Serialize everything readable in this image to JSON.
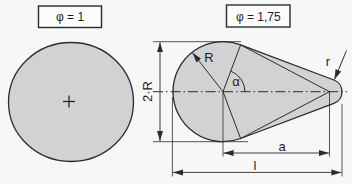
{
  "diagram": {
    "left_figure": {
      "caption": "φ = 1",
      "center_mark": "+"
    },
    "right_figure": {
      "caption": "φ = 1,75",
      "labels": {
        "large_radius": "R",
        "diameter": "2·R",
        "angle": "α",
        "tip_radius": "r",
        "center_distance": "a",
        "total_length": "l"
      }
    },
    "colors": {
      "shape_fill": "#d2d2d2",
      "line": "#2b2b2b",
      "background": "#f7f7f7",
      "caption_box_fill": "#fcfcfc"
    }
  }
}
